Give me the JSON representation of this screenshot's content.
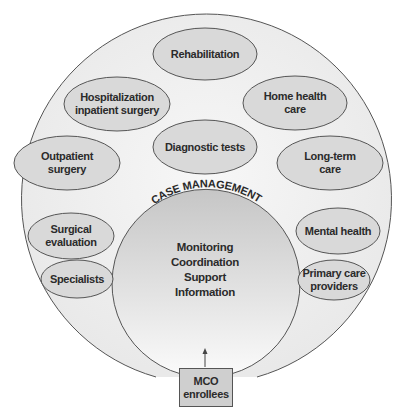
{
  "diagram": {
    "outer_ring_label": "",
    "center": {
      "title": "CASE MANAGEMENT",
      "lines": [
        "Monitoring",
        "Coordination",
        "Support",
        "Information"
      ]
    },
    "services": [
      {
        "id": "rehabilitation",
        "lines": [
          "Rehabilitation"
        ]
      },
      {
        "id": "hospitalization",
        "lines": [
          "Hospitalization",
          "inpatient surgery"
        ]
      },
      {
        "id": "home-health-care",
        "lines": [
          "Home health",
          "care"
        ]
      },
      {
        "id": "diagnostic-tests",
        "lines": [
          "Diagnostic tests"
        ]
      },
      {
        "id": "outpatient-surgery",
        "lines": [
          "Outpatient",
          "surgery"
        ]
      },
      {
        "id": "long-term-care",
        "lines": [
          "Long-term",
          "care"
        ]
      },
      {
        "id": "surgical-evaluation",
        "lines": [
          "Surgical",
          "evaluation"
        ]
      },
      {
        "id": "specialists",
        "lines": [
          "Specialists"
        ]
      },
      {
        "id": "mental-health",
        "lines": [
          "Mental health"
        ]
      },
      {
        "id": "primary-care-providers",
        "lines": [
          "Primary care",
          "providers"
        ]
      }
    ],
    "entry": {
      "lines": [
        "MCO",
        "enrollees"
      ]
    },
    "colors": {
      "ellipse_fill": "#d9d9d9",
      "outer_fill": "#f0f0f0",
      "inner_fill_top": "#c8c8c8",
      "inner_fill_bottom": "#f7f7f7",
      "box_fill": "#cfcfcf",
      "stroke": "#555555"
    }
  }
}
